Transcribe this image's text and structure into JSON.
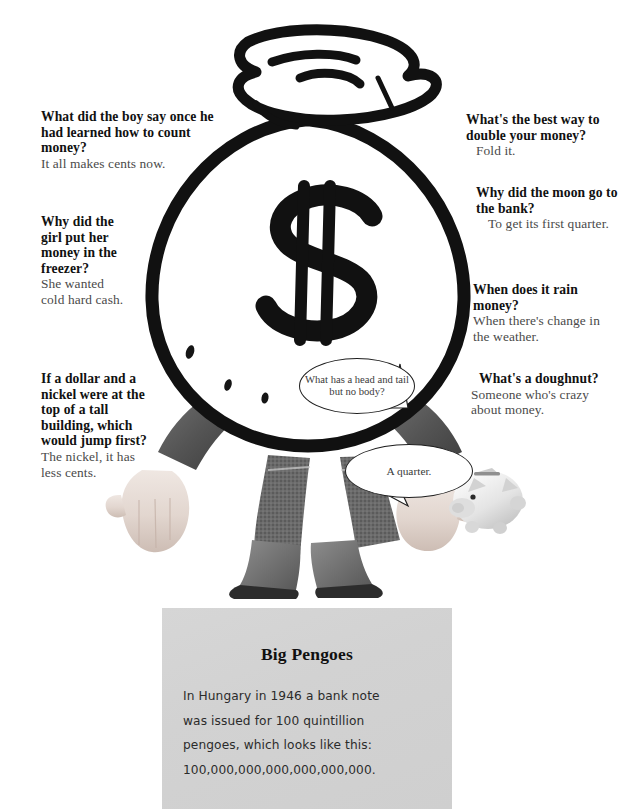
{
  "jokes_left": [
    {
      "id": "count-money",
      "question": "What did the boy say once he had learned how to count money?",
      "answer": "It all makes cents now."
    },
    {
      "id": "freezer",
      "question": "Why did the girl put her money in the freezer?",
      "answer": "She wanted cold hard cash."
    },
    {
      "id": "dollar-nickel",
      "question": "If a dollar and a nickel were at the top of a tall building, which would jump first?",
      "answer": "The nickel, it has less cents."
    }
  ],
  "jokes_right": [
    {
      "id": "double-money",
      "question": "What's the best way to double your money?",
      "answer": "Fold it."
    },
    {
      "id": "moon-bank",
      "question": "Why did the moon go to the bank?",
      "answer": "To get its first quarter."
    },
    {
      "id": "rain-money",
      "question": "When does it rain money?",
      "answer": "When there's change in the weather."
    },
    {
      "id": "doughnut",
      "question": "What's a doughnut?",
      "answer": "Someone who's crazy about money."
    }
  ],
  "bubbles": {
    "riddle": "What has a head and tail but no body?",
    "reply": "A quarter."
  },
  "factbox": {
    "title": "Big Pengoes",
    "lines": [
      "In Hungary in 1946 a bank note",
      "was issued for 100 quintillion",
      "pengoes, which looks like this:",
      "100,000,000,000,000,000,000."
    ]
  },
  "illustration": {
    "money_bag_symbol": "$",
    "alt": "money bag character with human legs in boots and hands holding a piggy bank"
  },
  "colors": {
    "ink": "#111111",
    "answer_gray": "#4a4a4a",
    "factbox_bg": "#d3d3d3",
    "page_bg": "#ffffff"
  }
}
